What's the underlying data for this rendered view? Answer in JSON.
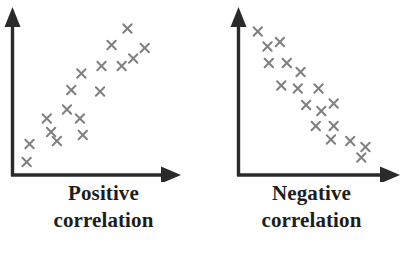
{
  "figure": {
    "background_color": "#ffffff",
    "axis_color": "#2a2a2a",
    "marker_color": "#808080",
    "caption_color": "#1d1d1d"
  },
  "panels": [
    {
      "id": "positive",
      "caption_line1": "Positive",
      "caption_line2": "correlation",
      "marker_glyph": "x"
    },
    {
      "id": "negative",
      "caption_line1": "Negative",
      "caption_line2": "correlation",
      "marker_glyph": "x"
    }
  ],
  "chart_data": [
    {
      "type": "scatter",
      "title": "Positive correlation",
      "xlabel": "",
      "ylabel": "",
      "xlim": [
        0,
        100
      ],
      "ylim": [
        0,
        100
      ],
      "grid": false,
      "legend": "none",
      "axis_style": "two-arrowed-axes",
      "marker": "x",
      "marker_color": "#808080",
      "points": [
        {
          "x": 6,
          "y": 4
        },
        {
          "x": 8,
          "y": 16
        },
        {
          "x": 27,
          "y": 18
        },
        {
          "x": 23,
          "y": 24
        },
        {
          "x": 45,
          "y": 22
        },
        {
          "x": 20,
          "y": 33
        },
        {
          "x": 34,
          "y": 39
        },
        {
          "x": 43,
          "y": 33
        },
        {
          "x": 37,
          "y": 52
        },
        {
          "x": 57,
          "y": 51
        },
        {
          "x": 44,
          "y": 63
        },
        {
          "x": 58,
          "y": 68
        },
        {
          "x": 72,
          "y": 68
        },
        {
          "x": 80,
          "y": 73
        },
        {
          "x": 65,
          "y": 82
        },
        {
          "x": 88,
          "y": 80
        },
        {
          "x": 76,
          "y": 93
        }
      ]
    },
    {
      "type": "scatter",
      "title": "Negative correlation",
      "xlabel": "",
      "ylabel": "",
      "xlim": [
        0,
        100
      ],
      "ylim": [
        0,
        100
      ],
      "grid": false,
      "legend": "none",
      "axis_style": "two-arrowed-axes",
      "marker": "x",
      "marker_color": "#808080",
      "points": [
        {
          "x": 10,
          "y": 91
        },
        {
          "x": 17,
          "y": 81
        },
        {
          "x": 26,
          "y": 84
        },
        {
          "x": 18,
          "y": 70
        },
        {
          "x": 31,
          "y": 70
        },
        {
          "x": 41,
          "y": 64
        },
        {
          "x": 27,
          "y": 55
        },
        {
          "x": 39,
          "y": 53
        },
        {
          "x": 54,
          "y": 53
        },
        {
          "x": 45,
          "y": 42
        },
        {
          "x": 56,
          "y": 38
        },
        {
          "x": 65,
          "y": 43
        },
        {
          "x": 52,
          "y": 28
        },
        {
          "x": 65,
          "y": 28
        },
        {
          "x": 63,
          "y": 19
        },
        {
          "x": 77,
          "y": 18
        },
        {
          "x": 88,
          "y": 14
        },
        {
          "x": 85,
          "y": 7
        }
      ]
    }
  ]
}
